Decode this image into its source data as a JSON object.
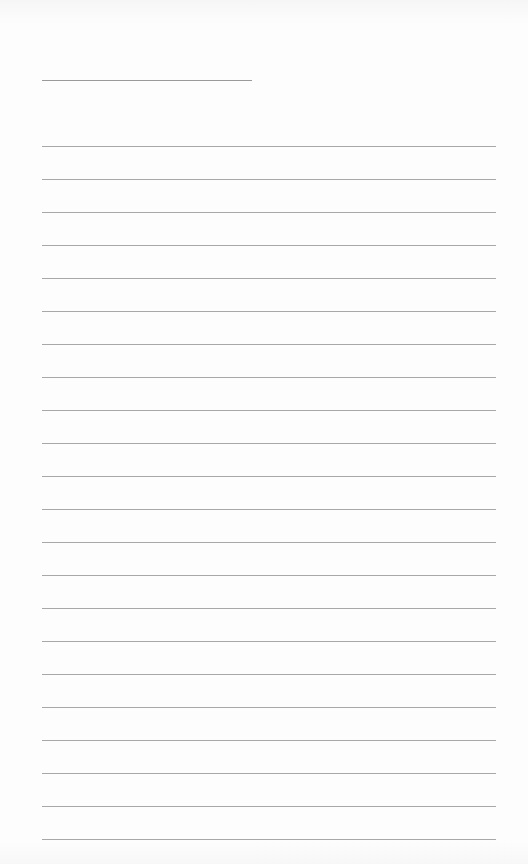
{
  "page": {
    "type": "lined-paper",
    "background_color": "#fdfdfd",
    "line_color": "#a8a8a8",
    "header_line": {
      "x": 42,
      "y": 80,
      "width": 210
    },
    "ruled_lines": {
      "count": 22,
      "start_y": 146,
      "spacing": 33,
      "x": 42,
      "width": 454
    }
  }
}
